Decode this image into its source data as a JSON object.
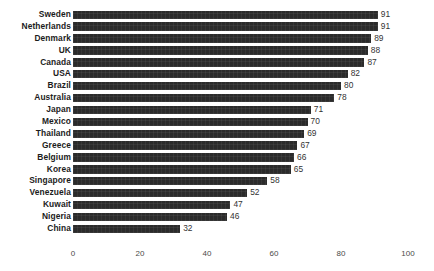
{
  "chart_data": {
    "type": "bar",
    "orientation": "horizontal",
    "title": "",
    "subtitle": "",
    "xlabel": "",
    "ylabel": "",
    "xlim": [
      0,
      100
    ],
    "xticks": [
      "0",
      "20",
      "40",
      "60",
      "80",
      "100"
    ],
    "xtick_values": [
      0,
      20,
      40,
      60,
      80,
      100
    ],
    "grid": false,
    "legend": null,
    "bar_color": "#2b2b2b",
    "value_labels_shown": true,
    "categories": [
      "Sweden",
      "Netherlands",
      "Denmark",
      "UK",
      "Canada",
      "USA",
      "Brazil",
      "Australia",
      "Japan",
      "Mexico",
      "Thailand",
      "Greece",
      "Belgium",
      "Korea",
      "Singapore",
      "Venezuela",
      "Kuwait",
      "Nigeria",
      "China"
    ],
    "values": [
      91,
      91,
      89,
      88,
      87,
      82,
      80,
      78,
      71,
      70,
      69,
      67,
      66,
      65,
      58,
      52,
      47,
      46,
      32
    ],
    "bars": [
      {
        "category": "Sweden",
        "value": 91,
        "label": "91"
      },
      {
        "category": "Netherlands",
        "value": 91,
        "label": "91"
      },
      {
        "category": "Denmark",
        "value": 89,
        "label": "89"
      },
      {
        "category": "UK",
        "value": 88,
        "label": "88"
      },
      {
        "category": "Canada",
        "value": 87,
        "label": "87"
      },
      {
        "category": "USA",
        "value": 82,
        "label": "82"
      },
      {
        "category": "Brazil",
        "value": 80,
        "label": "80"
      },
      {
        "category": "Australia",
        "value": 78,
        "label": "78"
      },
      {
        "category": "Japan",
        "value": 71,
        "label": "71"
      },
      {
        "category": "Mexico",
        "value": 70,
        "label": "70"
      },
      {
        "category": "Thailand",
        "value": 69,
        "label": "69"
      },
      {
        "category": "Greece",
        "value": 67,
        "label": "67"
      },
      {
        "category": "Belgium",
        "value": 66,
        "label": "66"
      },
      {
        "category": "Korea",
        "value": 65,
        "label": "65"
      },
      {
        "category": "Singapore",
        "value": 58,
        "label": "58"
      },
      {
        "category": "Venezuela",
        "value": 52,
        "label": "52"
      },
      {
        "category": "Kuwait",
        "value": 47,
        "label": "47"
      },
      {
        "category": "Nigeria",
        "value": 46,
        "label": "46"
      },
      {
        "category": "China",
        "value": 32,
        "label": "32"
      }
    ]
  }
}
